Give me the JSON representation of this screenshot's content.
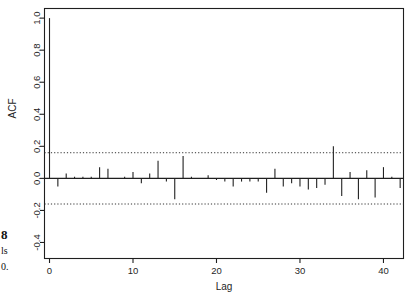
{
  "figure": {
    "caption_fragments": {
      "bold": "8",
      "middle": "ls",
      "lower": "0."
    }
  },
  "chart_data": {
    "type": "bar",
    "title": "",
    "subtitle": "",
    "xlabel": "Lag",
    "ylabel": "ACF",
    "xlim": [
      -0.6,
      42.4
    ],
    "ylim": [
      -0.5,
      1.06
    ],
    "grid": false,
    "legend": null,
    "xticks": [
      0,
      10,
      20,
      30,
      40
    ],
    "xtick_labels": [
      "0",
      "10",
      "20",
      "30",
      "40"
    ],
    "yticks": [
      -0.4,
      -0.2,
      0.0,
      0.2,
      0.4,
      0.6,
      0.8,
      1.0
    ],
    "ytick_labels": [
      "-0.4",
      "-0.2",
      "0.0",
      "0.2",
      "0.4",
      "0.6",
      "0.8",
      "1.0"
    ],
    "baseline": 0.0,
    "confidence_bands": {
      "upper": 0.16,
      "lower": -0.16,
      "style": "dotted",
      "color": "#333333"
    },
    "series_color": "#222222",
    "categories": [
      0,
      1,
      2,
      3,
      4,
      5,
      6,
      7,
      8,
      9,
      10,
      11,
      12,
      13,
      14,
      15,
      16,
      17,
      18,
      19,
      20,
      21,
      22,
      23,
      24,
      25,
      26,
      27,
      28,
      29,
      30,
      31,
      32,
      33,
      34,
      35,
      36,
      37,
      38,
      39,
      40,
      41,
      42
    ],
    "values": [
      1.0,
      -0.05,
      0.03,
      0.01,
      0.01,
      0.01,
      0.07,
      0.06,
      0.0,
      0.01,
      0.04,
      -0.03,
      0.03,
      0.11,
      -0.02,
      -0.13,
      0.14,
      0.01,
      0.0,
      0.02,
      -0.01,
      -0.02,
      -0.05,
      -0.02,
      -0.02,
      -0.02,
      -0.09,
      0.06,
      -0.05,
      -0.03,
      -0.05,
      -0.07,
      -0.06,
      -0.04,
      0.2,
      -0.11,
      0.04,
      -0.13,
      0.05,
      -0.12,
      0.07,
      0.01,
      -0.06
    ]
  }
}
